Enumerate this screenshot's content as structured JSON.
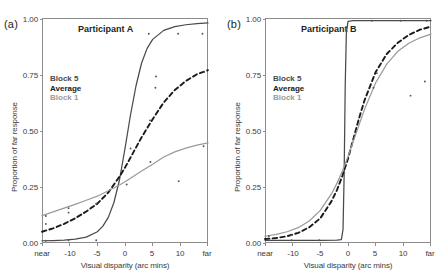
{
  "figure": {
    "panels": [
      {
        "tag": "(a)",
        "title": "Participant A",
        "legend": {
          "block5": "Block 5",
          "average": "Average",
          "block1": "Block 1"
        }
      },
      {
        "tag": "(b)",
        "title": "Participant B",
        "legend": {
          "block5": "Block 5",
          "average": "Average",
          "block1": "Block 1"
        }
      }
    ],
    "axis": {
      "ylabel": "Proportion of far response",
      "xlabel": "Visual disparity (arc mins)",
      "yticks": [
        "0.00",
        "0.25",
        "0.50",
        "0.75",
        "1.00"
      ],
      "xticks": [
        "near",
        "-10",
        "-5",
        "0",
        "5",
        "10",
        "far"
      ]
    },
    "colors": {
      "block5": "#4a4a4a",
      "average": "#1a1a1a",
      "block1": "#9a9a9a",
      "frame": "#8c8c8c",
      "text": "#231f20"
    }
  },
  "chart_data": [
    {
      "type": "line",
      "title": "Participant A",
      "panel": "(a)",
      "xlabel": "Visual disparity (arc mins)",
      "ylabel": "Proportion of far response",
      "xlim": [
        -15,
        15
      ],
      "ylim": [
        0.0,
        1.0
      ],
      "xticks": [
        -15,
        -10,
        -5,
        0,
        5,
        10,
        15
      ],
      "xticklabels": [
        "near",
        "-10",
        "-5",
        "0",
        "5",
        "10",
        "far"
      ],
      "yticks": [
        0.0,
        0.25,
        0.5,
        0.75,
        1.0
      ],
      "grid": false,
      "legend": [
        "Block 5",
        "Average",
        "Block 1"
      ],
      "legend_position": "upper left inside",
      "series": [
        {
          "name": "Block 5",
          "style": "solid",
          "color": "#4a4a4a",
          "x": [
            -15,
            -13,
            -11,
            -9,
            -7,
            -5,
            -4,
            -3,
            -2,
            -1,
            0,
            1,
            2,
            3,
            4,
            5,
            7,
            9,
            11,
            13,
            15
          ],
          "values": [
            0.01,
            0.011,
            0.013,
            0.017,
            0.026,
            0.05,
            0.075,
            0.115,
            0.18,
            0.28,
            0.42,
            0.57,
            0.7,
            0.8,
            0.865,
            0.905,
            0.945,
            0.962,
            0.97,
            0.975,
            0.978
          ]
        },
        {
          "name": "Average",
          "style": "dashed",
          "color": "#1a1a1a",
          "x": [
            -15,
            -13,
            -11,
            -9,
            -7,
            -5,
            -3,
            -1,
            0,
            1,
            3,
            5,
            7,
            9,
            11,
            13,
            15
          ],
          "values": [
            0.05,
            0.065,
            0.085,
            0.11,
            0.14,
            0.175,
            0.225,
            0.295,
            0.335,
            0.38,
            0.47,
            0.55,
            0.625,
            0.68,
            0.72,
            0.75,
            0.768
          ]
        },
        {
          "name": "Block 1",
          "style": "solid",
          "color": "#9a9a9a",
          "x": [
            -15,
            -13,
            -11,
            -9,
            -7,
            -5,
            -3,
            -1,
            0,
            1,
            3,
            5,
            7,
            9,
            11,
            13,
            15
          ],
          "values": [
            0.122,
            0.138,
            0.155,
            0.172,
            0.19,
            0.208,
            0.232,
            0.258,
            0.272,
            0.288,
            0.32,
            0.35,
            0.382,
            0.405,
            0.422,
            0.435,
            0.445
          ]
        }
      ],
      "scatter_points": [
        {
          "x": -14.3,
          "y": 0.01
        },
        {
          "x": -10.2,
          "y": 0.012
        },
        {
          "x": -5.2,
          "y": 0.012
        },
        {
          "x": -14.3,
          "y": 0.085
        },
        {
          "x": -10.2,
          "y": 0.135
        },
        {
          "x": -5.2,
          "y": 0.175
        },
        {
          "x": -14.3,
          "y": 0.12
        },
        {
          "x": -10.2,
          "y": 0.155
        },
        {
          "x": 0.3,
          "y": 0.26
        },
        {
          "x": 1.0,
          "y": 0.42
        },
        {
          "x": 4.5,
          "y": 0.545
        },
        {
          "x": 4.6,
          "y": 0.36
        },
        {
          "x": 5.5,
          "y": 0.69
        },
        {
          "x": 5.6,
          "y": 0.74
        },
        {
          "x": 9.6,
          "y": 0.93
        },
        {
          "x": 9.7,
          "y": 0.275
        },
        {
          "x": 4.3,
          "y": 0.93
        },
        {
          "x": 14.0,
          "y": 0.93
        },
        {
          "x": 14.2,
          "y": 0.43
        },
        {
          "x": 14.3,
          "y": 0.76
        }
      ]
    },
    {
      "type": "line",
      "title": "Participant B",
      "panel": "(b)",
      "xlabel": "Visual disparity (arc mins)",
      "ylabel": "Proportion of far response",
      "xlim": [
        -15,
        15
      ],
      "ylim": [
        0.0,
        1.0
      ],
      "xticks": [
        -15,
        -10,
        -5,
        0,
        5,
        10,
        15
      ],
      "xticklabels": [
        "near",
        "-10",
        "-5",
        "0",
        "5",
        "10",
        "far"
      ],
      "yticks": [
        0.0,
        0.25,
        0.5,
        0.75,
        1.0
      ],
      "grid": false,
      "legend": [
        "Block 5",
        "Average",
        "Block 1"
      ],
      "legend_position": "upper left inside",
      "series": [
        {
          "name": "Block 5",
          "style": "solid",
          "color": "#4a4a4a",
          "x": [
            -15,
            -10,
            -5,
            -2,
            -1.2,
            -0.9,
            -0.7,
            -0.5,
            -0.3,
            0,
            1,
            5,
            10,
            15
          ],
          "values": [
            0.012,
            0.012,
            0.012,
            0.013,
            0.015,
            0.06,
            0.3,
            0.7,
            0.93,
            0.985,
            0.988,
            0.988,
            0.988,
            0.988
          ]
        },
        {
          "name": "Average",
          "style": "dashed",
          "color": "#1a1a1a",
          "x": [
            -15,
            -13,
            -11,
            -9,
            -7,
            -5,
            -3,
            -2,
            -1,
            0,
            1,
            2,
            3,
            5,
            7,
            9,
            11,
            13,
            15
          ],
          "values": [
            0.018,
            0.022,
            0.03,
            0.045,
            0.07,
            0.11,
            0.185,
            0.235,
            0.3,
            0.375,
            0.465,
            0.555,
            0.635,
            0.76,
            0.84,
            0.89,
            0.925,
            0.948,
            0.962
          ]
        },
        {
          "name": "Block 1",
          "style": "solid",
          "color": "#9a9a9a",
          "x": [
            -15,
            -13,
            -11,
            -9,
            -7,
            -5,
            -3,
            -2,
            -1,
            0,
            1,
            2,
            3,
            5,
            7,
            9,
            11,
            13,
            15
          ],
          "values": [
            0.03,
            0.038,
            0.05,
            0.068,
            0.098,
            0.145,
            0.218,
            0.265,
            0.32,
            0.385,
            0.455,
            0.525,
            0.595,
            0.712,
            0.795,
            0.852,
            0.888,
            0.912,
            0.928
          ]
        }
      ],
      "scatter_points": [
        {
          "x": -14.3,
          "y": 0.012
        },
        {
          "x": -10.2,
          "y": 0.012
        },
        {
          "x": -5.2,
          "y": 0.012
        },
        {
          "x": -14.3,
          "y": 0.03
        },
        {
          "x": -10.2,
          "y": 0.035
        },
        {
          "x": 4.3,
          "y": 0.988
        },
        {
          "x": 9.5,
          "y": 0.988
        },
        {
          "x": 14.2,
          "y": 0.988
        },
        {
          "x": 13.9,
          "y": 0.718
        },
        {
          "x": 11.3,
          "y": 0.655
        },
        {
          "x": 4.6,
          "y": 0.69
        },
        {
          "x": 5.2,
          "y": 0.755
        }
      ]
    }
  ]
}
